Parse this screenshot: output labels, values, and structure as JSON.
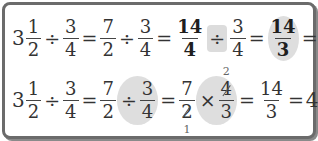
{
  "row1": {
    "mixed1": {
      "whole": "3",
      "num": "1",
      "den": "2"
    },
    "div1": "÷",
    "f2": {
      "num": "3",
      "den": "4"
    },
    "eq1": "=",
    "f3": {
      "num": "7",
      "den": "2"
    },
    "div2": "÷",
    "f4": {
      "num": "3",
      "den": "4"
    },
    "eq2": "=",
    "f5": {
      "num": "14",
      "den": "4"
    },
    "div3": "÷",
    "f6": {
      "num": "3",
      "den": "4"
    },
    "eq3": "=",
    "f7": {
      "num": "14",
      "den": "3"
    },
    "eq4": "=",
    "result": {
      "whole": "4",
      "num": "2",
      "den": "3"
    }
  },
  "row2": {
    "mixed1": {
      "whole": "3",
      "num": "1",
      "den": "2"
    },
    "div1": "÷",
    "f2": {
      "num": "3",
      "den": "4"
    },
    "eq1": "=",
    "f3": {
      "num": "7",
      "den": "2"
    },
    "div2": "÷",
    "f4": {
      "num": "3",
      "den": "4"
    },
    "eq2": "=",
    "f5": {
      "num": "7",
      "den": "2",
      "den_cancel": "1"
    },
    "times": "×",
    "f6": {
      "num": "4",
      "num_cancel": "2",
      "den": "3"
    },
    "eq3": "=",
    "f7": {
      "num": "14",
      "den": "3"
    },
    "eq4": "=",
    "result": {
      "whole": "4",
      "num": "2",
      "den": "3"
    }
  },
  "colors": {
    "border": "#6b6b6b",
    "highlight": "#dcdcdc",
    "text": "#333333"
  }
}
